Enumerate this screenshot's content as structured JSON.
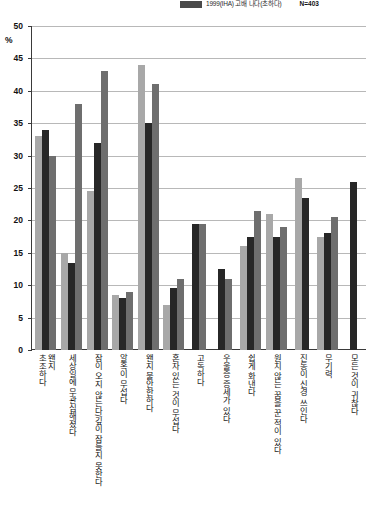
{
  "legend": {
    "swatch_color": "#4a4a4a",
    "label": "1999(IHA) 고배 나다(초하다)",
    "sample_size": "N=403"
  },
  "axis": {
    "percent_sign": "%",
    "y_ticks": [
      "50",
      "45",
      "40",
      "35",
      "30",
      "25",
      "20",
      "15",
      "10",
      "5",
      "0"
    ]
  },
  "colors": {
    "series1": "#a8a8a8",
    "series2": "#272727",
    "series3": "#6e6e6e",
    "gridline": "#b8b8b8",
    "axis": "#3a3a3a"
  },
  "chart_data": {
    "type": "bar",
    "title": "",
    "subtitle": "",
    "xlabel": "",
    "ylabel": "%",
    "ylim": [
      0,
      50
    ],
    "ytick_step": 5,
    "grid": true,
    "legend_position": "top-right",
    "categories": [
      "왠지\n초조하다",
      "세상일에 무관심해졌다",
      "잠이 오지 않는다/깊이 잠들지 못한다",
      "알혹이 무섭다",
      "왠지 불안한하다",
      "혼자 있는 것이 무섭다",
      "고독하다",
      "우울증 증세가 있다",
      "쉽게 화낸다",
      "원치 않는 꿈을 꾼 적이 있다",
      "진동이 신경 쓰인다",
      "무기력",
      "모든 것이 귀찮다"
    ],
    "series": [
      {
        "name": "series-1",
        "color": "#a8a8a8",
        "values": [
          33,
          15,
          24.5,
          8.5,
          44,
          7,
          0,
          0,
          16,
          21,
          26.5,
          17.5,
          0
        ]
      },
      {
        "name": "series-2",
        "color": "#272727",
        "values": [
          34,
          13.5,
          32,
          8,
          35,
          9.5,
          19.5,
          12.5,
          17.5,
          17.5,
          23.5,
          18,
          26
        ]
      },
      {
        "name": "series-3",
        "color": "#6e6e6e",
        "values": [
          30,
          38,
          43,
          9,
          41,
          11,
          19.5,
          11,
          21.5,
          19,
          0,
          20.5,
          0
        ]
      }
    ]
  }
}
